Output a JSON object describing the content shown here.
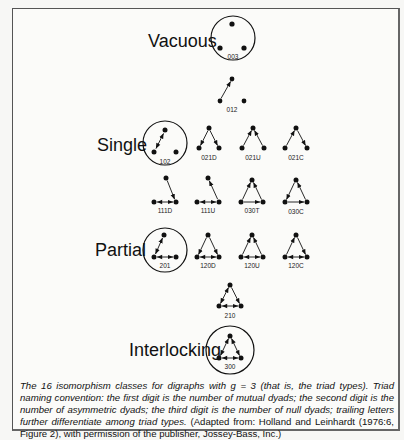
{
  "figure": {
    "groups": [
      {
        "label": "Vacuous",
        "triads": [
          "003"
        ]
      },
      {
        "label": "",
        "triads": [
          "012"
        ]
      },
      {
        "label": "Single",
        "triads": [
          "102",
          "021D",
          "021U",
          "021C"
        ]
      },
      {
        "label": "",
        "triads": [
          "111D",
          "111U",
          "030T",
          "030C"
        ]
      },
      {
        "label": "Partial",
        "triads": [
          "201",
          "120D",
          "120U",
          "120C"
        ]
      },
      {
        "label": "",
        "triads": [
          "210"
        ]
      },
      {
        "label": "Interlocking",
        "triads": [
          "300"
        ]
      }
    ],
    "labels": {
      "vacuous": "Vacuous",
      "single": "Single",
      "partial": "Partial",
      "interlocking": "Interlocking"
    },
    "triad_codes": {
      "t003": "003",
      "t012": "012",
      "t102": "102",
      "t021D": "021D",
      "t021U": "021U",
      "t021C": "021C",
      "t111D": "111D",
      "t111U": "111U",
      "t030T": "030T",
      "t030C": "030C",
      "t201": "201",
      "t120D": "120D",
      "t120U": "120U",
      "t120C": "120C",
      "t210": "210",
      "t300": "300"
    }
  },
  "caption": {
    "italic_part": "The 16 isomorphism classes for digraphs with g = 3 (that is, the triad types). Triad naming convention: the first digit is the number of mutual dyads; the second digit is the number of asymmetric dyads; the third digit is the number of null dyads; trailing letters further differentiate among triad types.",
    "roman_part": " (Adapted from: Holland and Leinhardt (1976:6, Figure 2), with permission of the publisher, Jossey-Bass, Inc.)"
  }
}
